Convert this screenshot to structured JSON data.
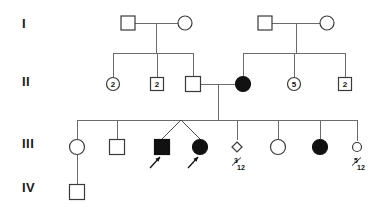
{
  "figure": {
    "kind": "pedigree-chart",
    "width": 386,
    "height": 212,
    "background_color": "#ffffff",
    "line_color": "#6b6b6b",
    "symbol_outline_color": "#3a3a3a",
    "affected_fill_color": "#111111",
    "unaffected_fill_color": "#ffffff"
  },
  "generations": [
    {
      "id": "gen-1",
      "label": "I",
      "x": 22,
      "y": 28
    },
    {
      "id": "gen-2",
      "label": "II",
      "x": 22,
      "y": 86
    },
    {
      "id": "gen-3",
      "label": "III",
      "x": 22,
      "y": 148
    },
    {
      "id": "gen-4",
      "label": "IV",
      "x": 22,
      "y": 192
    }
  ],
  "individuals": [
    {
      "id": "I-1",
      "generation": "I",
      "shape": "square",
      "sex": "male",
      "status": "unaffected",
      "cx": 128,
      "cy": 23,
      "size": 14,
      "count_label": "",
      "age_label": "",
      "proband": false
    },
    {
      "id": "I-2",
      "generation": "I",
      "shape": "circle",
      "sex": "female",
      "status": "unaffected",
      "cx": 185,
      "cy": 23,
      "size": 14,
      "count_label": "",
      "age_label": "",
      "proband": false
    },
    {
      "id": "I-3",
      "generation": "I",
      "shape": "square",
      "sex": "male",
      "status": "unaffected",
      "cx": 265,
      "cy": 23,
      "size": 14,
      "count_label": "",
      "age_label": "",
      "proband": false
    },
    {
      "id": "I-4",
      "generation": "I",
      "shape": "circle",
      "sex": "female",
      "status": "unaffected",
      "cx": 327,
      "cy": 23,
      "size": 14,
      "count_label": "",
      "age_label": "",
      "proband": false
    },
    {
      "id": "II-1",
      "generation": "II",
      "shape": "circle",
      "sex": "female",
      "status": "unaffected",
      "cx": 113,
      "cy": 84,
      "size": 13,
      "count_label": "2",
      "age_label": "",
      "proband": false
    },
    {
      "id": "II-2",
      "generation": "II",
      "shape": "square",
      "sex": "male",
      "status": "unaffected",
      "cx": 157,
      "cy": 84,
      "size": 13,
      "count_label": "2",
      "age_label": "",
      "proband": false
    },
    {
      "id": "II-3",
      "generation": "II",
      "shape": "square",
      "sex": "male",
      "status": "unaffected",
      "cx": 193,
      "cy": 84,
      "size": 15,
      "count_label": "",
      "age_label": "",
      "proband": false
    },
    {
      "id": "II-4",
      "generation": "II",
      "shape": "circle",
      "sex": "female",
      "status": "affected",
      "cx": 243,
      "cy": 84,
      "size": 15,
      "count_label": "",
      "age_label": "",
      "proband": false
    },
    {
      "id": "II-5",
      "generation": "II",
      "shape": "circle",
      "sex": "female",
      "status": "unaffected",
      "cx": 294,
      "cy": 84,
      "size": 13,
      "count_label": "5",
      "age_label": "",
      "proband": false
    },
    {
      "id": "II-6",
      "generation": "II",
      "shape": "square",
      "sex": "male",
      "status": "unaffected",
      "cx": 345,
      "cy": 84,
      "size": 13,
      "count_label": "2",
      "age_label": "",
      "proband": false
    },
    {
      "id": "III-1",
      "generation": "III",
      "shape": "circle",
      "sex": "female",
      "status": "unaffected",
      "cx": 77,
      "cy": 147,
      "size": 15,
      "count_label": "",
      "age_label": "",
      "proband": false
    },
    {
      "id": "III-2",
      "generation": "III",
      "shape": "square",
      "sex": "male",
      "status": "unaffected",
      "cx": 117,
      "cy": 147,
      "size": 15,
      "count_label": "",
      "age_label": "",
      "proband": false
    },
    {
      "id": "III-3",
      "generation": "III",
      "shape": "square",
      "sex": "male",
      "status": "affected",
      "cx": 162,
      "cy": 147,
      "size": 15,
      "count_label": "",
      "age_label": "",
      "proband": true
    },
    {
      "id": "III-4",
      "generation": "III",
      "shape": "circle",
      "sex": "female",
      "status": "affected",
      "cx": 200,
      "cy": 147,
      "size": 15,
      "count_label": "",
      "age_label": "",
      "proband": true
    },
    {
      "id": "III-5",
      "generation": "III",
      "shape": "diamond",
      "sex": "unknown",
      "status": "unaffected",
      "cx": 237,
      "cy": 147,
      "size": 10,
      "count_label": "",
      "age_label": "3/12",
      "proband": false
    },
    {
      "id": "III-6",
      "generation": "III",
      "shape": "circle",
      "sex": "female",
      "status": "unaffected",
      "cx": 278,
      "cy": 147,
      "size": 15,
      "count_label": "",
      "age_label": "",
      "proband": false
    },
    {
      "id": "III-7",
      "generation": "III",
      "shape": "circle",
      "sex": "female",
      "status": "affected",
      "cx": 320,
      "cy": 147,
      "size": 15,
      "count_label": "",
      "age_label": "",
      "proband": false
    },
    {
      "id": "III-8",
      "generation": "III",
      "shape": "circle",
      "sex": "female",
      "status": "unaffected",
      "cx": 357,
      "cy": 147,
      "size": 9,
      "count_label": "",
      "age_label": "5/12",
      "proband": false
    },
    {
      "id": "IV-1",
      "generation": "IV",
      "shape": "square",
      "sex": "male",
      "status": "unaffected",
      "cx": 77,
      "cy": 192,
      "size": 15,
      "count_label": "",
      "age_label": "",
      "proband": false
    }
  ],
  "age_labels": [
    {
      "id": "age-III-5",
      "numerator": "3",
      "denominator": "12",
      "x": 237,
      "y": 163
    },
    {
      "id": "age-III-8",
      "numerator": "5",
      "denominator": "12",
      "x": 357,
      "y": 163
    }
  ],
  "connections": {
    "mating_lines": [
      {
        "id": "mate-I-left",
        "x1": 135,
        "x2": 178,
        "y": 23
      },
      {
        "id": "mate-I-right",
        "x1": 272,
        "x2": 320,
        "y": 23
      },
      {
        "id": "mate-II-mid",
        "x1": 201,
        "x2": 236,
        "y": 84
      }
    ],
    "descent_lines": [
      {
        "id": "desc-I-left",
        "x": 156,
        "y1": 23,
        "y2": 53
      },
      {
        "id": "desc-I-right",
        "x": 296,
        "y1": 23,
        "y2": 53
      },
      {
        "id": "desc-II-mid",
        "x": 218,
        "y1": 84,
        "y2": 120
      }
    ],
    "sibship_bars": [
      {
        "id": "sib-II-left",
        "x1": 113,
        "x2": 193,
        "y": 53
      },
      {
        "id": "sib-II-right",
        "x1": 243,
        "x2": 345,
        "y": 53
      },
      {
        "id": "sib-III",
        "x1": 77,
        "x2": 357,
        "y": 120
      }
    ],
    "child_stems": [
      {
        "id": "stem-II-1",
        "x": 113,
        "y1": 53,
        "y2": 77
      },
      {
        "id": "stem-II-2",
        "x": 157,
        "y1": 53,
        "y2": 77
      },
      {
        "id": "stem-II-3",
        "x": 193,
        "y1": 53,
        "y2": 76
      },
      {
        "id": "stem-II-4",
        "x": 243,
        "y1": 53,
        "y2": 76
      },
      {
        "id": "stem-II-5",
        "x": 294,
        "y1": 53,
        "y2": 77
      },
      {
        "id": "stem-II-6",
        "x": 345,
        "y1": 53,
        "y2": 77
      },
      {
        "id": "stem-III-1",
        "x": 77,
        "y1": 120,
        "y2": 139
      },
      {
        "id": "stem-III-2",
        "x": 117,
        "y1": 120,
        "y2": 139
      },
      {
        "id": "stem-III-5",
        "x": 237,
        "y1": 120,
        "y2": 140
      },
      {
        "id": "stem-III-6",
        "x": 278,
        "y1": 120,
        "y2": 139
      },
      {
        "id": "stem-III-7",
        "x": 320,
        "y1": 120,
        "y2": 139
      },
      {
        "id": "stem-III-8",
        "x": 357,
        "y1": 120,
        "y2": 141
      },
      {
        "id": "stem-IV-1",
        "x": 77,
        "y1": 155,
        "y2": 184
      }
    ],
    "twin_group": {
      "id": "twins-III-3-4",
      "apex_x": 181,
      "apex_y": 120,
      "left_x": 162,
      "left_y": 139,
      "right_x": 200,
      "right_y": 139
    }
  },
  "proband_arrows": [
    {
      "id": "arrow-III-3",
      "tail_x": 150,
      "tail_y": 168,
      "head_x": 160,
      "head_y": 157
    },
    {
      "id": "arrow-III-4",
      "tail_x": 188,
      "tail_y": 168,
      "head_x": 198,
      "head_y": 157
    }
  ]
}
